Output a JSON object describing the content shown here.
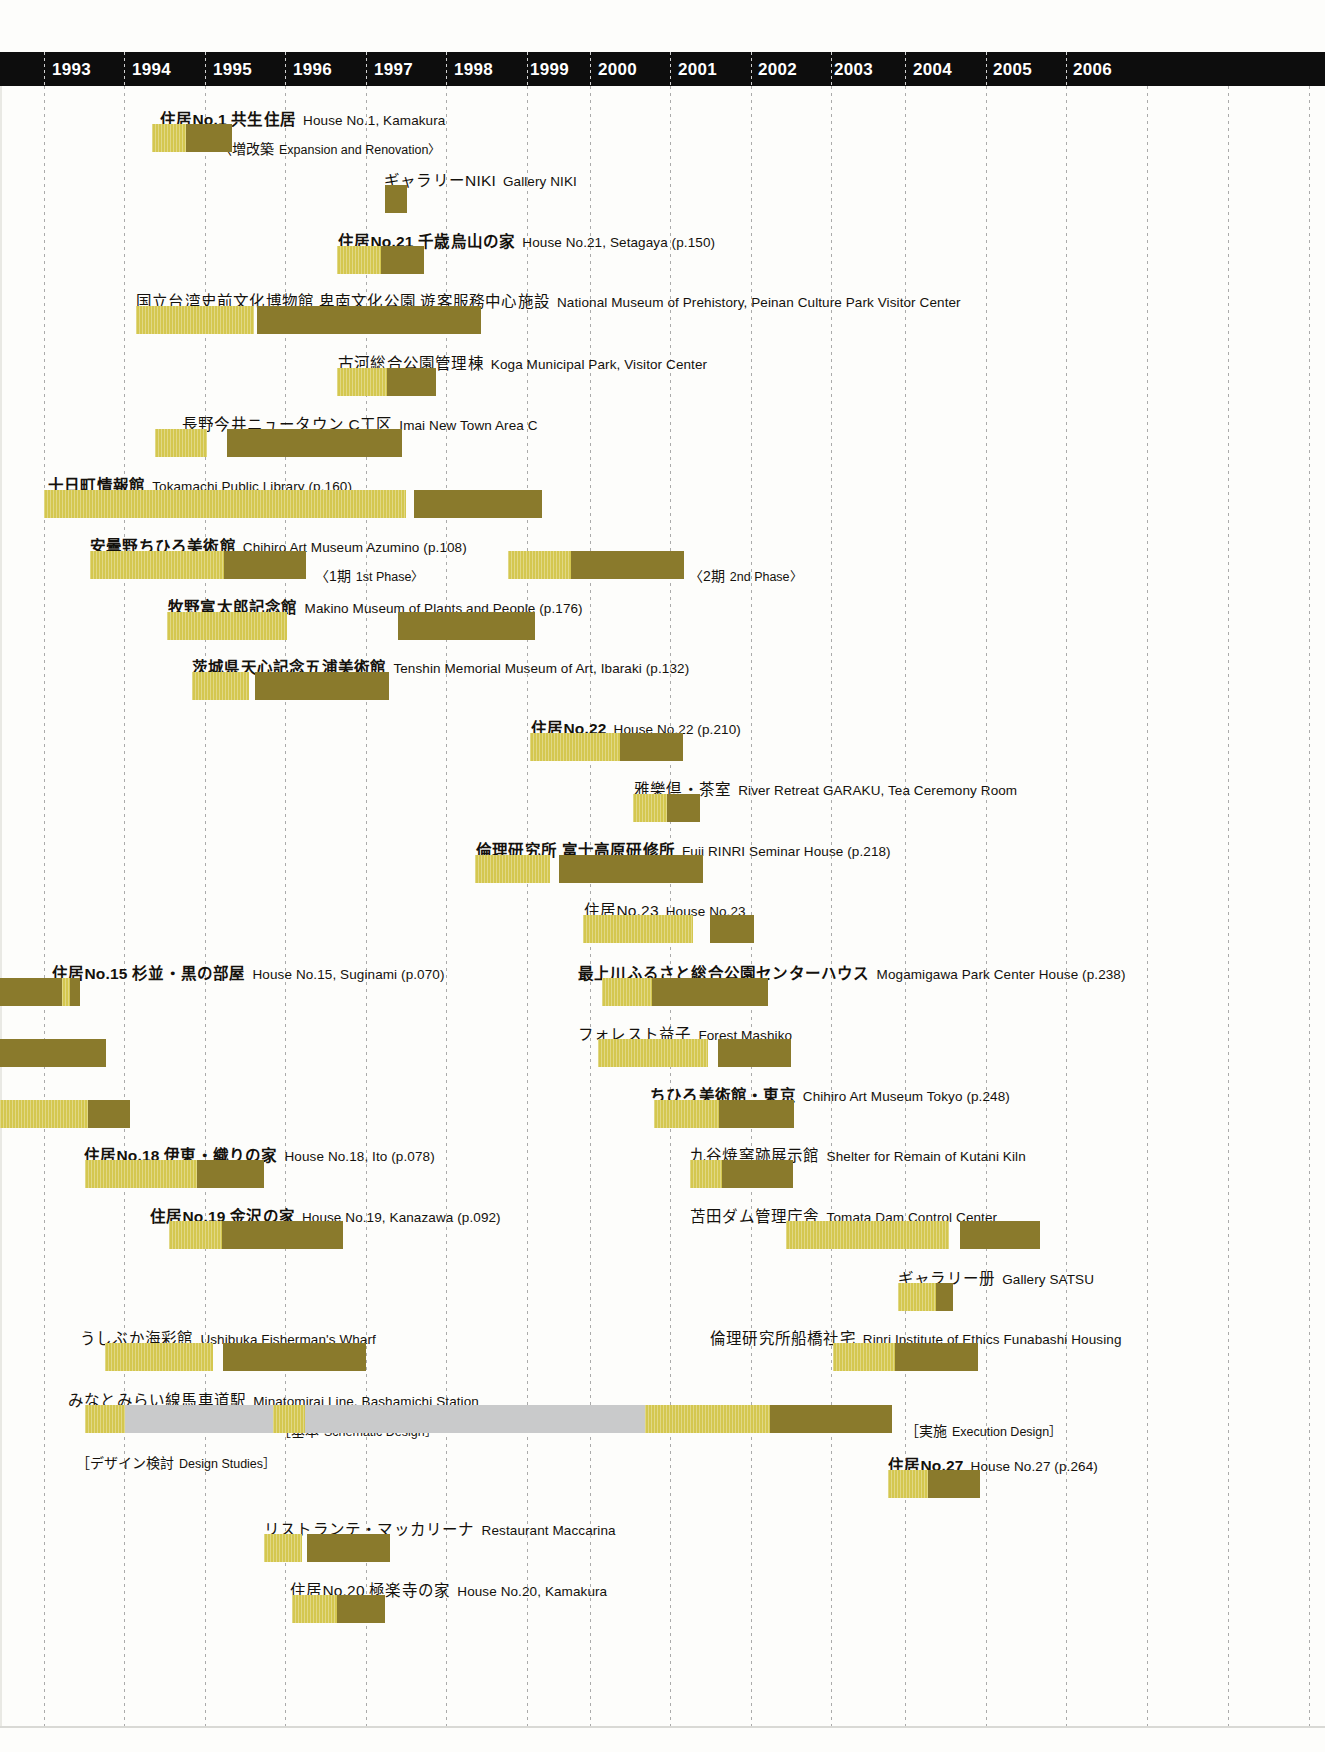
{
  "chart_data": {
    "type": "bar",
    "xlabel": "Year",
    "ylabel": "",
    "axis": {
      "years": [
        "1993",
        "1994",
        "1995",
        "1996",
        "1997",
        "1998",
        "1999",
        "2000",
        "2001",
        "2002",
        "2003",
        "2004",
        "2005",
        "2006"
      ],
      "xlim": [
        1993,
        2007
      ],
      "grid": true,
      "legend_position": "none"
    },
    "colors": {
      "design_phase": "#d4c74f",
      "construction_phase": "#8a7a2c",
      "study_phase": "#c9cacb",
      "header_band": "#0d0d0d",
      "background": "#fdfdfb"
    },
    "phase_legend": [
      {
        "key": "design_phase",
        "label": "design / light bar"
      },
      {
        "key": "construction_phase",
        "label": "construction / dark bar"
      },
      {
        "key": "study_phase",
        "label": "studies / gray bar"
      }
    ],
    "projects": [
      {
        "jp": "住居No.1 共生住居",
        "en": "House No.1, Kamakura",
        "bold": true,
        "label_x": 160,
        "label_y": 26,
        "note": {
          "jp": "〈増改築",
          "en": "Expansion and Renovation〉",
          "x": 218,
          "y": 56
        },
        "bars": [
          {
            "phase": "design_phase",
            "x": 152,
            "w": 34,
            "start": 1994.25,
            "end": 1994.6
          },
          {
            "phase": "construction_phase",
            "x": 186,
            "w": 46,
            "start": 1994.6,
            "end": 1995.1
          }
        ]
      },
      {
        "jp": "ギャラリーNIKI",
        "en": "Gallery NIKI",
        "bold": false,
        "label_x": 384,
        "label_y": 87,
        "bars": [
          {
            "phase": "construction_phase",
            "x": 385,
            "w": 22,
            "start": 1996.8,
            "end": 1997.0
          }
        ]
      },
      {
        "jp": "住居No.21 千歳烏山の家",
        "en": "House No.21, Setagaya (p.150)",
        "bold": true,
        "label_x": 338,
        "label_y": 148,
        "bars": [
          {
            "phase": "design_phase",
            "x": 337,
            "w": 44,
            "start": 1996.3,
            "end": 1996.8
          },
          {
            "phase": "construction_phase",
            "x": 381,
            "w": 43,
            "start": 1996.8,
            "end": 1997.3
          }
        ]
      },
      {
        "jp": "国立台湾史前文化博物館 卑南文化公園 遊客服務中心施設",
        "en": "National Museum of Prehistory, Peinan Culture Park Visitor Center",
        "bold": false,
        "label_x": 136,
        "label_y": 208,
        "bars": [
          {
            "phase": "design_phase",
            "x": 136,
            "w": 118,
            "start": 1994.05,
            "end": 1995.35
          },
          {
            "phase": "construction_phase",
            "x": 257,
            "w": 224,
            "start": 1995.4,
            "end": 1997.85
          }
        ]
      },
      {
        "jp": "古河総合公園管理棟",
        "en": "Koga Municipal Park, Visitor Center",
        "bold": false,
        "label_x": 338,
        "label_y": 270,
        "bars": [
          {
            "phase": "design_phase",
            "x": 337,
            "w": 50,
            "start": 1996.3,
            "end": 1996.85
          },
          {
            "phase": "construction_phase",
            "x": 387,
            "w": 49,
            "start": 1996.85,
            "end": 1997.4
          }
        ]
      },
      {
        "jp": "長野今井ニュータウン C工区",
        "en": "Imai New Town Area C",
        "bold": false,
        "label_x": 182,
        "label_y": 331,
        "bars": [
          {
            "phase": "design_phase",
            "x": 155,
            "w": 52,
            "start": 1994.3,
            "end": 1994.85
          },
          {
            "phase": "construction_phase",
            "x": 227,
            "w": 175,
            "start": 1995.1,
            "end": 1997.0
          }
        ]
      },
      {
        "jp": "十日町情報館",
        "en": "Tokamachi Public Library (p.160)",
        "bold": true,
        "label_x": 48,
        "label_y": 392,
        "bars": [
          {
            "phase": "design_phase",
            "x": 44,
            "w": 362,
            "start": 1993.0,
            "end": 1996.95
          },
          {
            "phase": "construction_phase",
            "x": 414,
            "w": 128,
            "start": 1997.05,
            "end": 1998.45
          }
        ]
      },
      {
        "jp": "安曇野ちひろ美術館",
        "en": "Chihiro Art Museum Azumino (p.108)",
        "bold": true,
        "label_x": 90,
        "label_y": 453,
        "note": {
          "jp": "〈1期",
          "en": "1st Phase〉",
          "x": 315,
          "y": 483
        },
        "note2": {
          "jp": "〈2期",
          "en": "2nd Phase〉",
          "x": 689,
          "y": 483
        },
        "bars": [
          {
            "phase": "design_phase",
            "x": 90,
            "w": 134,
            "start": 1993.5,
            "end": 1994.98
          },
          {
            "phase": "construction_phase",
            "x": 224,
            "w": 82,
            "start": 1994.98,
            "end": 1995.88
          },
          {
            "phase": "design_phase",
            "x": 508,
            "w": 63,
            "start": 1999.0,
            "end": 1999.7
          },
          {
            "phase": "construction_phase",
            "x": 571,
            "w": 113,
            "start": 1999.7,
            "end": 2000.95
          }
        ]
      },
      {
        "jp": "牧野富太郎記念館",
        "en": "Makino Museum of Plants and People (p.176)",
        "bold": true,
        "label_x": 168,
        "label_y": 514,
        "bars": [
          {
            "phase": "design_phase",
            "x": 167,
            "w": 120,
            "start": 1994.45,
            "end": 1995.75
          },
          {
            "phase": "construction_phase",
            "x": 398,
            "w": 137,
            "start": 1997.0,
            "end": 1998.5
          }
        ]
      },
      {
        "jp": "茨城県天心記念五浦美術館",
        "en": "Tenshin Memorial Museum of Art, Ibaraki (p.132)",
        "bold": true,
        "label_x": 192,
        "label_y": 574,
        "bars": [
          {
            "phase": "design_phase",
            "x": 192,
            "w": 57,
            "start": 1994.7,
            "end": 1995.3
          },
          {
            "phase": "construction_phase",
            "x": 255,
            "w": 134,
            "start": 1995.4,
            "end": 1996.85
          }
        ]
      },
      {
        "jp": "住居No.22",
        "en": "House No.22 (p.210)",
        "bold": true,
        "label_x": 531,
        "label_y": 635,
        "bars": [
          {
            "phase": "design_phase",
            "x": 530,
            "w": 90,
            "start": 1999.25,
            "end": 2000.25
          },
          {
            "phase": "construction_phase",
            "x": 620,
            "w": 63,
            "start": 2000.25,
            "end": 2000.95
          }
        ]
      },
      {
        "jp": "雅樂倶・茶室",
        "en": "River Retreat GARAKU, Tea Ceremony Room",
        "bold": false,
        "label_x": 634,
        "label_y": 696,
        "bars": [
          {
            "phase": "design_phase",
            "x": 633,
            "w": 34,
            "start": 2000.4,
            "end": 2000.8
          },
          {
            "phase": "construction_phase",
            "x": 667,
            "w": 33,
            "start": 2000.8,
            "end": 2001.1
          }
        ]
      },
      {
        "jp": "倫理研究所 富士高原研修所",
        "en": "Fuji RINRI Seminar House (p.218)",
        "bold": true,
        "label_x": 476,
        "label_y": 757,
        "bars": [
          {
            "phase": "design_phase",
            "x": 475,
            "w": 75,
            "start": 1998.65,
            "end": 1999.5
          },
          {
            "phase": "construction_phase",
            "x": 559,
            "w": 144,
            "start": 1999.6,
            "end": 2001.2
          }
        ]
      },
      {
        "jp": "住居No.23",
        "en": "House No.23",
        "bold": false,
        "label_x": 584,
        "label_y": 817,
        "bars": [
          {
            "phase": "design_phase",
            "x": 583,
            "w": 110,
            "start": 1999.85,
            "end": 2001.05
          },
          {
            "phase": "construction_phase",
            "x": 710,
            "w": 44,
            "start": 2001.25,
            "end": 2001.75
          }
        ]
      },
      {
        "jp": "住居No.15 杉並・黒の部屋",
        "en": "House No.15, Suginami (p.070)",
        "bold": true,
        "label_x": 52,
        "label_y": 880,
        "bars": [
          {
            "phase": "construction_phase",
            "x": 0,
            "w": 80,
            "start": 1992.0,
            "end": 1993.4,
            "clipped_left": true
          },
          {
            "phase": "design_phase",
            "x": 62,
            "w": 8,
            "start": 1993.2,
            "end": 1993.3
          },
          {
            "phase": "construction_phase",
            "x": 70,
            "w": 10,
            "start": 1993.3,
            "end": 1993.4
          }
        ]
      },
      {
        "jp": "最上川ふるさと総合公園センターハウス",
        "en": "Mogamigawa Park Center House (p.238)",
        "bold": true,
        "label_x": 578,
        "label_y": 880,
        "bars": [
          {
            "phase": "design_phase",
            "x": 602,
            "w": 50,
            "start": 2000.1,
            "end": 2000.6
          },
          {
            "phase": "construction_phase",
            "x": 652,
            "w": 116,
            "start": 2000.6,
            "end": 2001.9
          }
        ]
      },
      {
        "jp": "フォレスト益子",
        "en": "Forest Mashiko",
        "bold": false,
        "label_x": 578,
        "label_y": 941,
        "bars": [
          {
            "phase": "construction_phase",
            "x": 0,
            "w": 106,
            "start": 1992.0,
            "end": 1993.7,
            "clipped_left": true
          },
          {
            "phase": "design_phase",
            "x": 598,
            "w": 110,
            "start": 2000.05,
            "end": 2001.25
          },
          {
            "phase": "construction_phase",
            "x": 718,
            "w": 73,
            "start": 2001.35,
            "end": 2002.1
          }
        ]
      },
      {
        "jp": "ちひろ美術館・東京",
        "en": "Chihiro Art Museum Tokyo (p.248)",
        "bold": true,
        "label_x": 650,
        "label_y": 1002,
        "bars": [
          {
            "phase": "design_phase",
            "x": 0,
            "w": 88,
            "start": 1992.0,
            "end": 1993.5,
            "clipped_left": true
          },
          {
            "phase": "construction_phase",
            "x": 88,
            "w": 42,
            "start": 1993.5,
            "end": 1993.95
          },
          {
            "phase": "design_phase",
            "x": 654,
            "w": 65,
            "start": 2000.6,
            "end": 2001.3
          },
          {
            "phase": "construction_phase",
            "x": 719,
            "w": 75,
            "start": 2001.3,
            "end": 2002.1
          }
        ]
      },
      {
        "jp": "住居No.18 伊東・織りの家",
        "en": "House No.18, Ito (p.078)",
        "bold": true,
        "label_x": 84,
        "label_y": 1062,
        "bars": [
          {
            "phase": "design_phase",
            "x": 85,
            "w": 112,
            "start": 1993.5,
            "end": 1994.75
          },
          {
            "phase": "construction_phase",
            "x": 197,
            "w": 67,
            "start": 1994.75,
            "end": 1995.5
          }
        ]
      },
      {
        "jp": "九谷焼窯跡展示館",
        "en": "Shelter for Remain of Kutani Kiln",
        "bold": false,
        "label_x": 690,
        "label_y": 1062,
        "bars": [
          {
            "phase": "design_phase",
            "x": 690,
            "w": 32,
            "start": 2001.0,
            "end": 2001.35
          },
          {
            "phase": "construction_phase",
            "x": 722,
            "w": 71,
            "start": 2001.35,
            "end": 2002.1
          }
        ]
      },
      {
        "jp": "住居No.19 金沢の家",
        "en": "House No.19, Kanazawa (p.092)",
        "bold": true,
        "label_x": 150,
        "label_y": 1123,
        "bars": [
          {
            "phase": "design_phase",
            "x": 169,
            "w": 53,
            "start": 1994.5,
            "end": 1995.1
          },
          {
            "phase": "construction_phase",
            "x": 222,
            "w": 121,
            "start": 1995.1,
            "end": 1996.4
          }
        ]
      },
      {
        "jp": "苫田ダム管理庁舎",
        "en": "Tomata Dam Control Center",
        "bold": false,
        "label_x": 690,
        "label_y": 1123,
        "bars": [
          {
            "phase": "design_phase",
            "x": 786,
            "w": 163,
            "start": 2002.0,
            "end": 2003.75
          },
          {
            "phase": "construction_phase",
            "x": 960,
            "w": 80,
            "start": 2003.85,
            "end": 2004.7
          }
        ]
      },
      {
        "jp": "ギャラリー册",
        "en": "Gallery SATSU",
        "bold": false,
        "label_x": 898,
        "label_y": 1185,
        "bars": [
          {
            "phase": "design_phase",
            "x": 898,
            "w": 38,
            "start": 2003.35,
            "end": 2003.75
          },
          {
            "phase": "construction_phase",
            "x": 936,
            "w": 17,
            "start": 2003.75,
            "end": 2003.95
          }
        ]
      },
      {
        "jp": "うしぶか海彩館",
        "en": "Ushibuka Fisherman's Wharf",
        "bold": false,
        "label_x": 80,
        "label_y": 1245,
        "bars": [
          {
            "phase": "design_phase",
            "x": 105,
            "w": 108,
            "start": 1993.7,
            "end": 1994.9
          },
          {
            "phase": "construction_phase",
            "x": 223,
            "w": 143,
            "start": 1995.1,
            "end": 1996.65
          }
        ]
      },
      {
        "jp": "倫理研究所船橋社宅",
        "en": "Rinri Institute of Ethics Funabashi Housing",
        "bold": false,
        "label_x": 710,
        "label_y": 1245,
        "bars": [
          {
            "phase": "design_phase",
            "x": 833,
            "w": 62,
            "start": 2002.5,
            "end": 2003.2
          },
          {
            "phase": "construction_phase",
            "x": 895,
            "w": 83,
            "start": 2003.2,
            "end": 2004.1
          }
        ]
      },
      {
        "jp": "みなとみらい線馬車道駅",
        "en": "Minatomirai Line, Bashamichi Station",
        "bold": false,
        "label_x": 68,
        "label_y": 1307,
        "note": {
          "jp": "［基本",
          "en": "Schematic Design］",
          "x": 277,
          "y": 1338
        },
        "note2": {
          "jp": "［実施",
          "en": "Execution Design］",
          "x": 905,
          "y": 1338
        },
        "note3": {
          "jp": "［デザイン検討",
          "en": "Design Studies］",
          "x": 76,
          "y": 1370
        },
        "bars": [
          {
            "phase": "study_phase",
            "x": 85,
            "w": 805,
            "start": 1993.4,
            "end": 2003.3
          },
          {
            "phase": "design_phase",
            "x": 85,
            "w": 40,
            "start": 1993.4,
            "end": 1993.85
          },
          {
            "phase": "design_phase",
            "x": 273,
            "w": 32,
            "start": 1995.5,
            "end": 1995.85
          },
          {
            "phase": "design_phase",
            "x": 645,
            "w": 125,
            "start": 2000.5,
            "end": 2001.9
          },
          {
            "phase": "construction_phase",
            "x": 770,
            "w": 122,
            "start": 2001.9,
            "end": 2003.3
          }
        ]
      },
      {
        "jp": "住居No.27",
        "en": "House No.27 (p.264)",
        "bold": true,
        "label_x": 888,
        "label_y": 1372,
        "bars": [
          {
            "phase": "design_phase",
            "x": 888,
            "w": 40,
            "start": 2003.25,
            "end": 2003.7
          },
          {
            "phase": "construction_phase",
            "x": 928,
            "w": 52,
            "start": 2003.7,
            "end": 2004.25
          }
        ]
      },
      {
        "jp": "リストランテ・マッカリーナ",
        "en": "Restaurant Maccarina",
        "bold": false,
        "label_x": 264,
        "label_y": 1436,
        "bars": [
          {
            "phase": "design_phase",
            "x": 264,
            "w": 38,
            "start": 1995.4,
            "end": 1995.85
          },
          {
            "phase": "construction_phase",
            "x": 307,
            "w": 83,
            "start": 1995.9,
            "end": 1996.85
          }
        ]
      },
      {
        "jp": "住居No.20 極楽寺の家",
        "en": "House No.20, Kamakura",
        "bold": false,
        "label_x": 290,
        "label_y": 1497,
        "bars": [
          {
            "phase": "design_phase",
            "x": 292,
            "w": 45,
            "start": 1995.7,
            "end": 1996.2
          },
          {
            "phase": "construction_phase",
            "x": 337,
            "w": 48,
            "start": 1996.2,
            "end": 1996.75
          }
        ]
      }
    ]
  }
}
